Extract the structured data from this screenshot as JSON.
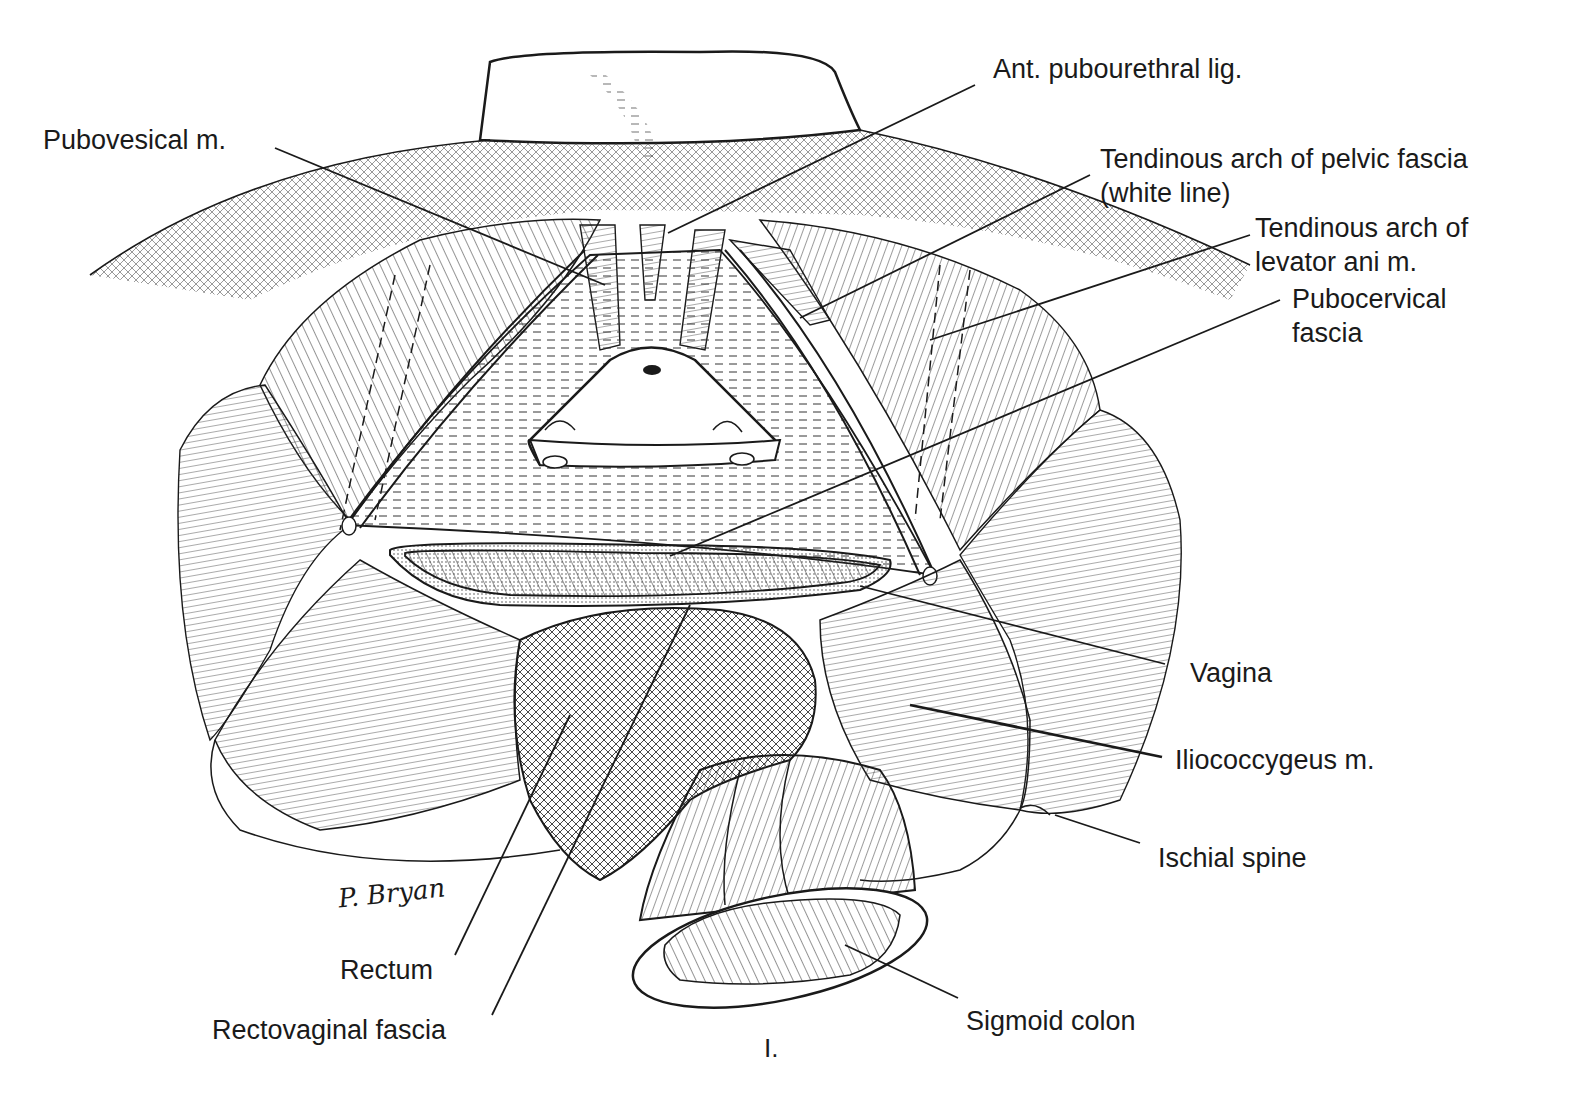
{
  "figure": {
    "plate_number": "I.",
    "signature": "P. Bryan",
    "colors": {
      "ink": "#1a1a1a",
      "paper": "#ffffff",
      "hatch": "#3a3a3a"
    }
  },
  "labels": {
    "ant_pubourethral_lig": {
      "text": "Ant. pubourethral lig."
    },
    "pubovesical_m": {
      "text": "Pubovesical m."
    },
    "tendinous_arch_pelvic_fascia": {
      "line1": "Tendinous arch of pelvic fascia",
      "line2": "(white line)"
    },
    "tendinous_arch_levator_ani": {
      "line1": "Tendinous arch of",
      "line2": "levator ani m."
    },
    "pubocervical_fascia": {
      "line1": "Pubocervical",
      "line2": "fascia"
    },
    "vagina": {
      "text": "Vagina"
    },
    "iliococcygeus_m": {
      "text": "Iliococcygeus m."
    },
    "ischial_spine": {
      "text": "Ischial spine"
    },
    "rectum": {
      "text": "Rectum"
    },
    "rectovaginal_fascia": {
      "text": "Rectovaginal fascia"
    },
    "sigmoid_colon": {
      "text": "Sigmoid colon"
    }
  }
}
